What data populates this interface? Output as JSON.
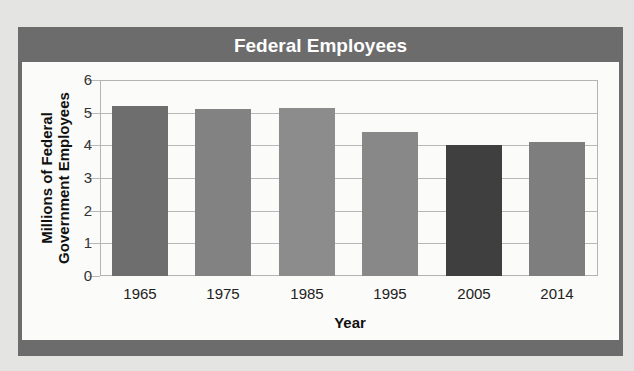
{
  "chart_data": {
    "type": "bar",
    "title": "Federal Employees",
    "xlabel": "Year",
    "ylabel": "Millions of Federal Government Employees",
    "categories": [
      "1965",
      "1975",
      "1985",
      "1995",
      "2005",
      "2014"
    ],
    "values": [
      5.2,
      5.1,
      5.15,
      4.4,
      4.0,
      4.1
    ],
    "bar_colors": [
      "#6e6e6e",
      "#828282",
      "#8c8c8c",
      "#888888",
      "#3f3f3f",
      "#7e7e7e"
    ],
    "yticks": [
      "0",
      "1",
      "2",
      "3",
      "4",
      "5",
      "6"
    ],
    "ylim": [
      0,
      6
    ],
    "grid": true,
    "legend": null
  },
  "frame": {
    "color": "#6c6c6c"
  },
  "ylabel_lines": [
    "Millions of Federal",
    "Government Employees"
  ]
}
